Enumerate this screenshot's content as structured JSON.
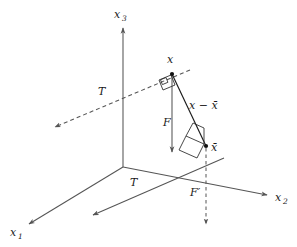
{
  "figure": {
    "background_color": "#ffffff",
    "width": 297,
    "height": 247,
    "axes": [
      {
        "id": "x1",
        "label": "x",
        "subscript": "1",
        "label_x": 10,
        "label_y": 236,
        "sub_x": 18,
        "sub_y": 239
      },
      {
        "id": "x2",
        "label": "x",
        "subscript": "2",
        "label_x": 275,
        "label_y": 201,
        "sub_x": 283,
        "sub_y": 204
      },
      {
        "id": "x3",
        "label": "x",
        "subscript": "3",
        "label_x": 114,
        "label_y": 18,
        "sub_x": 122,
        "sub_y": 21
      }
    ],
    "labels": [
      {
        "id": "T-upper",
        "text": "T",
        "x": 98,
        "y": 95,
        "kind": "subspace-line-label"
      },
      {
        "id": "T-lower",
        "text": "T",
        "x": 130,
        "y": 186,
        "kind": "subspace-line-label"
      },
      {
        "id": "x-point",
        "text": "x",
        "x": 167,
        "y": 63,
        "kind": "point-label"
      },
      {
        "id": "xbar-point",
        "text": "x̄",
        "x": 211,
        "y": 151,
        "kind": "point-label"
      },
      {
        "id": "F-label",
        "text": "F",
        "x": 163,
        "y": 126,
        "kind": "vector-label"
      },
      {
        "id": "Fprime-label",
        "text": "F′",
        "x": 190,
        "y": 196,
        "kind": "vector-label"
      },
      {
        "id": "diff-label",
        "text": "x − x̄",
        "x": 189,
        "y": 109,
        "kind": "vector-label"
      }
    ],
    "points": [
      {
        "id": "origin",
        "x": 123,
        "y": 167
      },
      {
        "id": "x",
        "x": 172,
        "y": 73
      },
      {
        "id": "xbar",
        "x": 206,
        "y": 146
      }
    ],
    "colors": {
      "stroke_dark": "#1a1a1a",
      "stroke_gray": "#555555",
      "background": "#ffffff"
    }
  }
}
